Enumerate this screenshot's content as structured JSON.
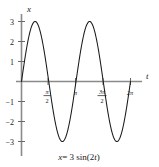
{
  "figure": {
    "caption": "x = 3 sin(2t)",
    "caption_parts": {
      "var": "x",
      "equals": "= 3 sin(2",
      "param": "t",
      "close": ")"
    }
  },
  "chart_data": {
    "type": "line",
    "title": "",
    "xlabel": "t",
    "ylabel": "x",
    "equation": "x = 3 sin(2t)",
    "amplitude": 3,
    "angular_frequency": 2,
    "period": 3.14159,
    "xlim": [
      0,
      6.28319
    ],
    "ylim": [
      -3.4,
      3.4
    ],
    "grid": false,
    "legend": null,
    "xticks": [
      1.5708,
      3.14159,
      4.71239,
      6.28319
    ],
    "xticklabels": [
      "π/2",
      "π",
      "3π/2",
      "2π"
    ],
    "xticklabel_parts": [
      {
        "num": "π",
        "den": "2",
        "whole": null
      },
      {
        "num": null,
        "den": null,
        "whole": "π"
      },
      {
        "num": "3π",
        "den": "2",
        "whole": null
      },
      {
        "num": null,
        "den": null,
        "whole": "2π"
      }
    ],
    "yticks": [
      3,
      2,
      1,
      -1,
      -2,
      -3
    ],
    "yticklabels": [
      "3",
      "2",
      "1",
      "−1",
      "−2",
      "−3"
    ],
    "series": [
      {
        "name": "x = 3 sin(2t)",
        "color": "#1a1a1a",
        "x": [
          0,
          0.19635,
          0.3927,
          0.58905,
          0.7854,
          0.98175,
          1.1781,
          1.37445,
          1.5708,
          1.76715,
          1.9635,
          2.15984,
          2.35619,
          2.55254,
          2.74889,
          2.94524,
          3.14159,
          3.33794,
          3.53429,
          3.73064,
          3.92699,
          4.12334,
          4.31969,
          4.51604,
          4.71239,
          4.90874,
          5.10509,
          5.30144,
          5.49779,
          5.69414,
          5.89049,
          6.08684,
          6.28319
        ],
        "y": [
          0,
          1.1481,
          2.1213,
          2.7716,
          3,
          2.7716,
          2.1213,
          1.1481,
          0,
          -1.1481,
          -2.1213,
          -2.7716,
          -3,
          -2.7716,
          -2.1213,
          -1.1481,
          0,
          1.1481,
          2.1213,
          2.7716,
          3,
          2.7716,
          2.1213,
          1.1481,
          0,
          -1.1481,
          -2.1213,
          -2.7716,
          -3,
          -2.7716,
          -2.1213,
          -1.1481,
          0
        ]
      }
    ],
    "peaks": [
      {
        "t": 0.7854,
        "x": 3
      },
      {
        "t": 3.92699,
        "x": 3
      }
    ],
    "troughs": [
      {
        "t": 2.35619,
        "x": -3
      },
      {
        "t": 5.49779,
        "x": -3
      }
    ],
    "zeros": [
      0,
      1.5708,
      3.14159,
      4.71239,
      6.28319
    ]
  },
  "colors": {
    "curve": "#1a1a1a",
    "axis": "#8a8a8a",
    "tick": "#6a6a6a",
    "background": "#ffffff",
    "text": "#1a1a1a"
  }
}
